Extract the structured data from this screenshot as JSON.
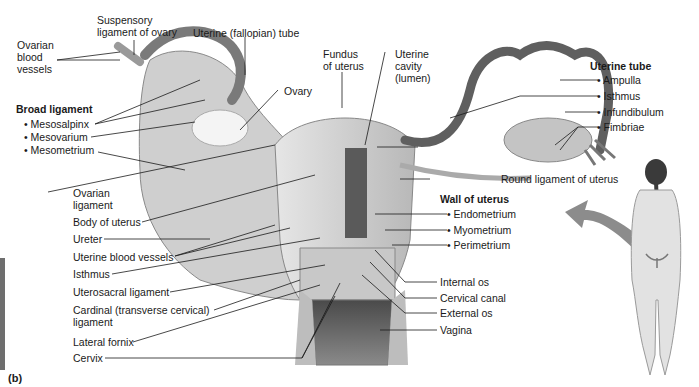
{
  "figure": {
    "panel_label": "(b)"
  },
  "labels_top": {
    "suspensory_ligament": "Suspensory ligament of ovary",
    "suspensory_line1": "Suspensory",
    "suspensory_line2": "ligament of ovary",
    "uterine_tube": "Uterine (fallopian) tube",
    "ovarian_vessels_line1": "Ovarian",
    "ovarian_vessels_line2": "blood",
    "ovarian_vessels_line3": "vessels",
    "ovary": "Ovary",
    "fundus_line1": "Fundus",
    "fundus_line2": "of uterus",
    "cavity_line1": "Uterine",
    "cavity_line2": "cavity",
    "cavity_line3": "(lumen)"
  },
  "broad_ligament": {
    "heading": "Broad ligament",
    "items": [
      "• Mesosalpinx",
      "• Mesovarium",
      "• Mesometrium"
    ]
  },
  "uterine_tube_group": {
    "heading": "Uterine tube",
    "items": [
      "• Ampulla",
      "• Isthmus",
      "• Infundibulum",
      "• Fimbriae"
    ]
  },
  "wall_of_uterus": {
    "heading": "Wall of uterus",
    "items": [
      "• Endometrium",
      "• Myometrium",
      "• Perimetrium"
    ]
  },
  "labels_left": {
    "ovarian_ligament_line1": "Ovarian",
    "ovarian_ligament_line2": "ligament",
    "body_of_uterus": "Body of uterus",
    "ureter": "Ureter",
    "uterine_blood_vessels": "Uterine blood vessels",
    "isthmus": "Isthmus",
    "uterosacral_ligament": "Uterosacral ligament",
    "cardinal_line1": "Cardinal (transverse cervical)",
    "cardinal_line2": "ligament",
    "lateral_fornix": "Lateral fornix",
    "cervix": "Cervix"
  },
  "labels_right": {
    "round_ligament": "Round ligament of uterus",
    "internal_os": "Internal os",
    "cervical_canal": "Cervical canal",
    "external_os": "External os",
    "vagina": "Vagina"
  },
  "colors": {
    "tissue_light": "#d9d9d9",
    "tissue_mid": "#b5b5b5",
    "tissue_dark": "#6a6a6a",
    "leader_line": "#1a1a1a",
    "arrow": "#8c8c8c"
  }
}
